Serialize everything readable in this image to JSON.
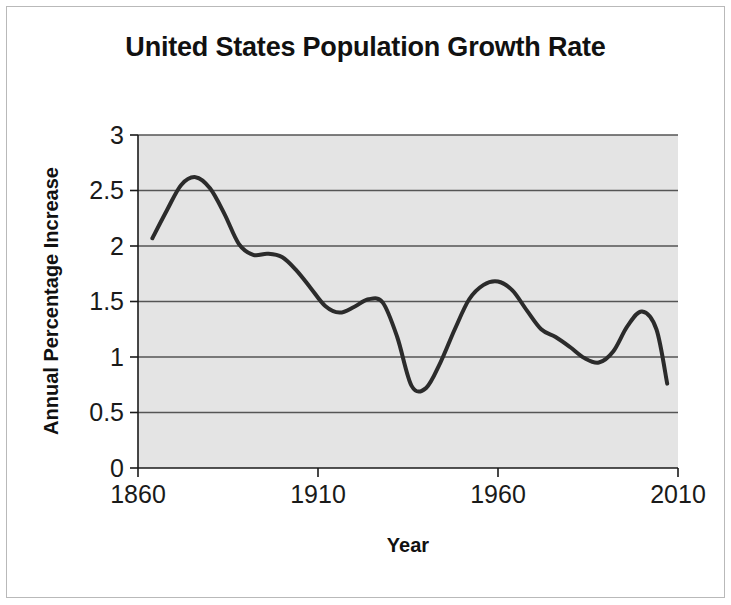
{
  "figure": {
    "title": "United States Population Growth Rate",
    "frame_color": "#b9b9b9",
    "background_color": "#ffffff"
  },
  "chart_data": {
    "type": "line",
    "title": "United States Population Growth Rate",
    "subtitle": "",
    "xlabel": "Year",
    "ylabel": "Annual Percentage Increase",
    "xlim": [
      1860,
      2010
    ],
    "ylim": [
      0,
      3
    ],
    "xticks": [
      1860,
      1910,
      1960,
      2010
    ],
    "xtick_labels": [
      "1860",
      "1910",
      "1960",
      "2010"
    ],
    "yticks": [
      0,
      0.5,
      1,
      1.5,
      2,
      2.5,
      3
    ],
    "ytick_labels": [
      "0",
      "0.5",
      "1",
      "1.5",
      "2",
      "2.5",
      "3"
    ],
    "grid": "horizontal",
    "grid_color": "#555555",
    "plot_background_color": "#e4e4e4",
    "legend": "none",
    "series": [
      {
        "name": "Annual Percentage Increase",
        "line_color": "#2b2b2b",
        "line_width": 4,
        "markers": "none",
        "x": [
          1864,
          1868,
          1872,
          1876,
          1880,
          1884,
          1888,
          1892,
          1896,
          1900,
          1904,
          1908,
          1912,
          1916,
          1920,
          1924,
          1928,
          1932,
          1936,
          1940,
          1944,
          1948,
          1952,
          1956,
          1960,
          1964,
          1968,
          1972,
          1976,
          1980,
          1984,
          1988,
          1992,
          1996,
          2000,
          2004,
          2007
        ],
        "y": [
          2.07,
          2.32,
          2.55,
          2.62,
          2.52,
          2.29,
          2.02,
          1.92,
          1.93,
          1.9,
          1.78,
          1.62,
          1.46,
          1.4,
          1.45,
          1.52,
          1.49,
          1.18,
          0.74,
          0.72,
          0.95,
          1.25,
          1.52,
          1.65,
          1.68,
          1.6,
          1.42,
          1.25,
          1.18,
          1.09,
          0.99,
          0.95,
          1.05,
          1.28,
          1.41,
          1.25,
          0.76
        ]
      }
    ],
    "annotations": []
  },
  "axis": {
    "y_title": "Annual Percentage Increase",
    "x_title": "Year"
  }
}
